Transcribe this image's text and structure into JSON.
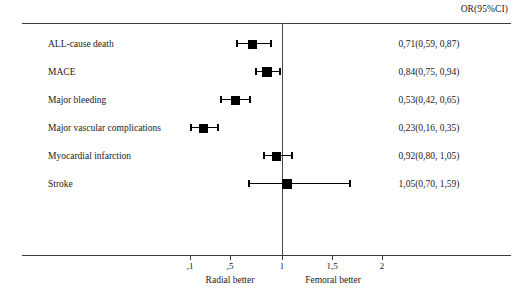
{
  "header": {
    "value_column_title": "OR(95%CI)"
  },
  "chart_data": {
    "type": "forest",
    "title": "",
    "xlabel": "",
    "ylabel": "",
    "value_column_title": "OR(95%CI)",
    "reference_line": 1,
    "xlim": [
      0.1,
      2.3
    ],
    "grid": false,
    "legend": "none",
    "axis": {
      "tick_values": [
        0.1,
        0.5,
        1,
        1.5,
        2
      ],
      "tick_labels": [
        ",1",
        ",5",
        "1",
        "1,5",
        "2"
      ],
      "tick_pixels": [
        190,
        230,
        282,
        332,
        382
      ]
    },
    "annotations": [
      {
        "text": "Radial better",
        "x_pixel": 230
      },
      {
        "text": "Femoral better",
        "x_pixel": 333
      }
    ],
    "rows": [
      {
        "label": "ALL-cause death",
        "estimate": 0.71,
        "ci_low": 0.59,
        "ci_high": 0.87,
        "value_text": "0,71(0,59, 0,87)",
        "box_px": 252,
        "low_px": 237,
        "high_px": 271,
        "box_size": 9
      },
      {
        "label": "MACE",
        "estimate": 0.84,
        "ci_low": 0.75,
        "ci_high": 0.94,
        "value_text": "0,84(0,75, 0,94)",
        "box_px": 267,
        "low_px": 256,
        "high_px": 280,
        "box_size": 10
      },
      {
        "label": "Major bleeding",
        "estimate": 0.53,
        "ci_low": 0.42,
        "ci_high": 0.65,
        "value_text": "0,53(0,42, 0,65)",
        "box_px": 235,
        "low_px": 221,
        "high_px": 250,
        "box_size": 9
      },
      {
        "label": "Major vascular complications",
        "estimate": 0.23,
        "ci_low": 0.16,
        "ci_high": 0.35,
        "value_text": "0,23(0,16, 0,35)",
        "box_px": 203,
        "low_px": 191,
        "high_px": 218,
        "box_size": 9
      },
      {
        "label": "Myocardial infarction",
        "estimate": 0.92,
        "ci_low": 0.8,
        "ci_high": 1.05,
        "value_text": "0,92(0,80, 1,05)",
        "box_px": 276,
        "low_px": 264,
        "high_px": 292,
        "box_size": 9
      },
      {
        "label": "Stroke",
        "estimate": 1.05,
        "ci_low": 0.7,
        "ci_high": 1.59,
        "value_text": "1,05(0,70, 1,59)",
        "box_px": 287,
        "low_px": 249,
        "high_px": 350,
        "box_size": 10
      }
    ]
  }
}
